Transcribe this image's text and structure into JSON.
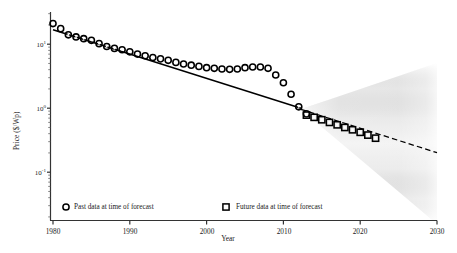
{
  "chart_data": {
    "type": "scatter",
    "title": "",
    "xlabel": "Year",
    "ylabel": "Price ($/Wp)",
    "yscale": "log",
    "xlim": [
      1980,
      2030
    ],
    "ylim": [
      0.03,
      30
    ],
    "grid": false,
    "xticks": [
      "1980",
      "1990",
      "2000",
      "2010",
      "2020",
      "2030"
    ],
    "xtick_values": [
      1980,
      1990,
      2000,
      2010,
      2020,
      2030
    ],
    "yticks": [
      "10¹",
      "10⁰",
      "10⁻¹"
    ],
    "ytick_values": [
      10,
      1,
      0.1
    ],
    "ytick_mantissa": "10",
    "ytick_exponents": [
      "1",
      "0",
      "-1"
    ],
    "legend": {
      "position": "lower-left-inside",
      "entries": [
        {
          "label": "Past data at time of forecast",
          "marker": "circle-dot",
          "color": "#000000"
        },
        {
          "label": "Future data at time of forecast",
          "marker": "square-dot",
          "color": "#000000"
        }
      ]
    },
    "series": [
      {
        "name": "Past data at time of forecast",
        "marker": "circle-dot",
        "color": "#000000",
        "x": [
          1980,
          1981,
          1982,
          1983,
          1984,
          1985,
          1986,
          1987,
          1988,
          1989,
          1990,
          1991,
          1992,
          1993,
          1994,
          1995,
          1996,
          1997,
          1998,
          1999,
          2000,
          2001,
          2002,
          2003,
          2004,
          2005,
          2006,
          2007,
          2008,
          2009,
          2010,
          2011,
          2012,
          2013
        ],
        "y": [
          21.0,
          17.5,
          14.0,
          13.0,
          12.2,
          11.5,
          10.2,
          9.2,
          8.6,
          8.2,
          7.6,
          7.0,
          6.6,
          6.2,
          5.9,
          5.6,
          5.2,
          4.9,
          4.7,
          4.5,
          4.3,
          4.2,
          4.1,
          4.05,
          4.1,
          4.3,
          4.4,
          4.4,
          4.2,
          3.3,
          2.5,
          1.65,
          1.05,
          0.82
        ]
      },
      {
        "name": "Future data at time of forecast",
        "marker": "square-dot",
        "color": "#000000",
        "x": [
          2013,
          2014,
          2015,
          2016,
          2017,
          2018,
          2019,
          2020,
          2021,
          2022
        ],
        "y": [
          0.78,
          0.72,
          0.66,
          0.6,
          0.55,
          0.5,
          0.46,
          0.42,
          0.38,
          0.34
        ]
      }
    ],
    "trend_line": {
      "name": "historical-trend",
      "style": "solid",
      "color": "#000000",
      "x": [
        1980,
        2013
      ],
      "y": [
        18.0,
        0.86
      ]
    },
    "forecast_median": {
      "name": "forecast-median",
      "style": "dashed",
      "color": "#000000",
      "x": [
        2013,
        2030
      ],
      "y": [
        0.82,
        0.2
      ]
    },
    "forecast_fan": {
      "name": "forecast-uncertainty-cone",
      "shading": "grayscale-density",
      "apex_x": 2013,
      "apex_y": 0.82,
      "end_x": 2030,
      "end_y_upper": 1.45,
      "end_y_lower": 0.028,
      "color_dark": "#2a2a2a",
      "color_light": "#f2f2f2"
    }
  },
  "axes": {
    "x_label": "Year",
    "y_label": "Price ($/Wp)"
  }
}
